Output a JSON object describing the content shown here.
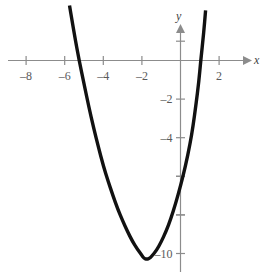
{
  "figure": {
    "background_color": "#ffffff",
    "axis_color": "#8c8c8c",
    "curve_color": "#111111",
    "label_color": "#5a5a5a"
  },
  "axes": {
    "x_name": "x",
    "y_name": "y"
  },
  "chart_data": {
    "type": "line",
    "title": "",
    "xlabel": "x",
    "ylabel": "y",
    "grid": false,
    "legend": null,
    "xlim": [
      -9.0,
      4.5
    ],
    "ylim": [
      -11.3,
      3.0
    ],
    "x_ticks": [
      -8,
      -6,
      -4,
      -2,
      2
    ],
    "x_tick_labels": [
      "–8",
      "–6",
      "–4",
      "–2",
      "2"
    ],
    "y_ticks": [
      -2,
      -4,
      -6,
      -8,
      -10
    ],
    "y_tick_labels": [
      "–2",
      "–4",
      "",
      "",
      "–10"
    ],
    "y_ticks_unlabeled": [
      -6,
      -8,
      1
    ],
    "curve": {
      "name": "parabola",
      "equation": "y = 1.6(x + 2.45)^2 - 10.3",
      "vertex": [
        -2.45,
        -10.3
      ],
      "roots": [
        -5.0,
        0.1
      ],
      "x_visible_range": [
        -5.75,
        0.85
      ],
      "points": [
        [
          -5.75,
          2.85
        ],
        [
          -5.5,
          1.35
        ],
        [
          -5.25,
          0.0
        ],
        [
          -5.0,
          -1.2
        ],
        [
          -4.75,
          -2.4
        ],
        [
          -4.5,
          -3.5
        ],
        [
          -4.25,
          -4.5
        ],
        [
          -4.0,
          -5.45
        ],
        [
          -3.75,
          -6.25
        ],
        [
          -3.5,
          -7.0
        ],
        [
          -3.25,
          -7.7
        ],
        [
          -3.0,
          -8.3
        ],
        [
          -2.75,
          -8.85
        ],
        [
          -2.5,
          -9.35
        ],
        [
          -2.25,
          -9.75
        ],
        [
          -2.0,
          -10.1
        ],
        [
          -1.9,
          -10.25
        ],
        [
          -1.75,
          -10.3
        ],
        [
          -1.6,
          -10.25
        ],
        [
          -1.5,
          -10.15
        ],
        [
          -1.25,
          -9.85
        ],
        [
          -1.0,
          -9.4
        ],
        [
          -0.75,
          -8.85
        ],
        [
          -0.5,
          -8.2
        ],
        [
          -0.25,
          -7.4
        ],
        [
          0.0,
          -6.5
        ],
        [
          0.25,
          -5.5
        ],
        [
          0.5,
          -4.3
        ],
        [
          0.65,
          -3.4
        ],
        [
          0.8,
          -2.3
        ],
        [
          0.95,
          -1.1
        ],
        [
          1.05,
          0.0
        ],
        [
          1.2,
          1.4
        ],
        [
          1.3,
          2.6
        ]
      ]
    }
  }
}
